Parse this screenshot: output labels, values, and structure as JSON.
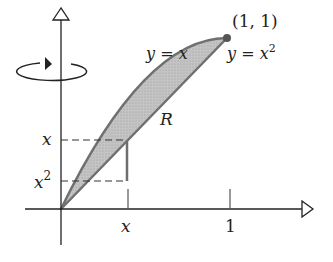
{
  "figure": {
    "point_label": "(1, 1)",
    "curve_upper_label": "y = x",
    "curve_lower_label": "y = x²",
    "region_label": "R",
    "y_tick_upper": "x",
    "y_tick_lower": "x²",
    "y_tick_lower_base": "x",
    "y_tick_lower_exp": "2",
    "x_tick_x": "x",
    "x_tick_1": "1",
    "upper_eq_lhs": "y",
    "upper_eq_rhs": "x",
    "lower_eq_lhs": "y",
    "lower_eq_rhs_base": "x",
    "lower_eq_rhs_exp": "2",
    "eq_sign": "=",
    "rotation_axis": "y-axis",
    "colors": {
      "region_fill": "#b8b8b8",
      "curve_stroke": "#6e6e6e",
      "axis_stroke": "#222222",
      "point_fill": "#555555"
    }
  }
}
